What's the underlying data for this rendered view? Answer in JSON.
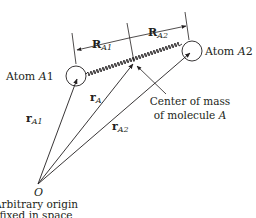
{
  "diagram": {
    "type": "molecule position vectors",
    "atoms": [
      {
        "id": "A1",
        "label": "Atom ",
        "label_italic": "A",
        "label_suffix": "1",
        "center": [
          76,
          76
        ],
        "radius": 10
      },
      {
        "id": "A2",
        "label": "Atom ",
        "label_italic": "A",
        "label_suffix": "2",
        "center": [
          192,
          51
        ],
        "radius": 10
      }
    ],
    "center_of_mass": {
      "point": [
        134,
        63
      ],
      "label_line1": "Center of mass",
      "label_line2_prefix": "of molecule ",
      "label_line2_italic": "A"
    },
    "origin": {
      "symbol": "O",
      "point": [
        38,
        184
      ],
      "caption_line1": "Arbitrary origin",
      "caption_line2": "fixed in space"
    },
    "vectors": [
      {
        "name": "r_A1",
        "bold": "r",
        "sub": "A1",
        "from": "O",
        "to": "A1"
      },
      {
        "name": "r_A",
        "bold": "r",
        "sub": "A",
        "from": "O",
        "to": "center_of_mass"
      },
      {
        "name": "r_A2",
        "bold": "r",
        "sub": "A2",
        "from": "O",
        "to": "A2"
      }
    ],
    "dimensions": [
      {
        "name": "R_A1",
        "bold": "R",
        "sub": "A1"
      },
      {
        "name": "R_A2",
        "bold": "R",
        "sub": "A2"
      }
    ],
    "colors": {
      "ink": "#231f20",
      "background": "#ffffff"
    }
  }
}
